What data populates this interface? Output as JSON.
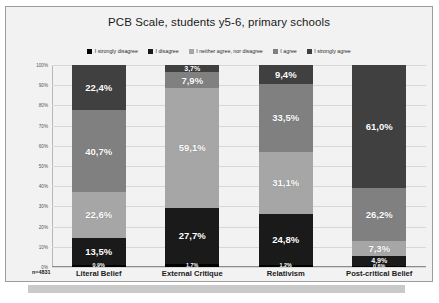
{
  "chart_data": {
    "type": "bar",
    "title": "PCB Scale, students y5-6, primary schools",
    "xlabel": "",
    "ylabel": "",
    "ylim": [
      0,
      100
    ],
    "grid": true,
    "legend_position": "top",
    "stacked": true,
    "sample_size_label": "n=4831",
    "categories": [
      "Literal Belief",
      "External Critique",
      "Relativism",
      "Post-critical Belief"
    ],
    "tick_labels": [
      "100%",
      "90%",
      "80%",
      "70%",
      "60%",
      "50%",
      "40%",
      "30%",
      "20%",
      "10%",
      "0%"
    ],
    "series": [
      {
        "name": "I strongly disagree",
        "color": "#000000",
        "values": [
          0.9,
          1.7,
          1.2,
          0.6
        ],
        "labels": [
          "0,9%",
          "1,7%",
          "1,2%",
          "0,6%"
        ]
      },
      {
        "name": "I disagree",
        "color": "#1a1a1a",
        "values": [
          13.5,
          27.7,
          24.8,
          4.9
        ],
        "labels": [
          "13,5%",
          "27,7%",
          "24,8%",
          "4,9%"
        ]
      },
      {
        "name": "I neither agree, nor disagree",
        "color": "#a6a6a6",
        "values": [
          22.6,
          59.1,
          31.1,
          7.3
        ],
        "labels": [
          "22,6%",
          "59,1%",
          "31,1%",
          "7,3%"
        ]
      },
      {
        "name": "I agree",
        "color": "#808080",
        "values": [
          40.7,
          7.9,
          33.5,
          26.2
        ],
        "labels": [
          "40,7%",
          "7,9%",
          "33,5%",
          "26,2%"
        ]
      },
      {
        "name": "I strongly agree",
        "color": "#404040",
        "values": [
          22.4,
          3.7,
          9.4,
          61.0
        ],
        "labels": [
          "22,4%",
          "3,7%",
          "9,4%",
          "61,0%"
        ]
      }
    ]
  },
  "caption": {
    "text": ""
  }
}
